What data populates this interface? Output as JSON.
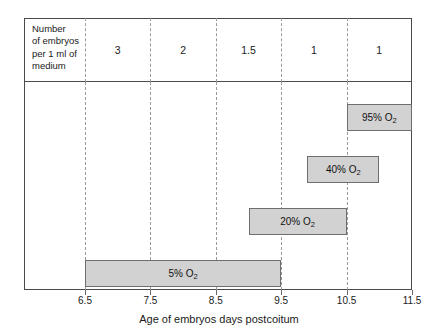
{
  "chart_data": {
    "type": "bar",
    "orientation": "horizontal-range",
    "title": "",
    "xlabel": "Age of embryos days postcoitum",
    "ylabel": "",
    "xlim": [
      6.5,
      11.5
    ],
    "xticks": [
      "6.5",
      "7.5",
      "8.5",
      "9.5",
      "10.5",
      "11.5"
    ],
    "grid": "dashed-vertical",
    "legend": "none",
    "series": [
      {
        "name": "5% O2",
        "label": "5% O",
        "sub": "2",
        "start": 6.5,
        "end": 9.5,
        "row": 3
      },
      {
        "name": "20% O2",
        "label": "20% O",
        "sub": "2",
        "start": 9.0,
        "end": 10.5,
        "row": 2
      },
      {
        "name": "40% O2",
        "label": "40% O",
        "sub": "2",
        "start": 9.9,
        "end": 11.0,
        "row": 1
      },
      {
        "name": "95% O2",
        "label": "95% O",
        "sub": "2",
        "start": 10.5,
        "end": 11.5,
        "row": 0
      }
    ],
    "header_table": {
      "row_label": [
        "Number",
        "of embryos",
        "per 1 ml of",
        "medium"
      ],
      "intervals": [
        "6.5-7.5",
        "7.5-8.5",
        "8.5-9.5",
        "9.5-10.5",
        "10.5-11.5"
      ],
      "values": [
        "3",
        "2",
        "1.5",
        "1",
        "1"
      ]
    },
    "colors": {
      "bar_fill": "#d2d2d2",
      "bar_stroke": "#6e6e6e",
      "frame": "#4a4a4a",
      "gridline": "#9a9a9a",
      "text": "#1a1a1a"
    }
  }
}
